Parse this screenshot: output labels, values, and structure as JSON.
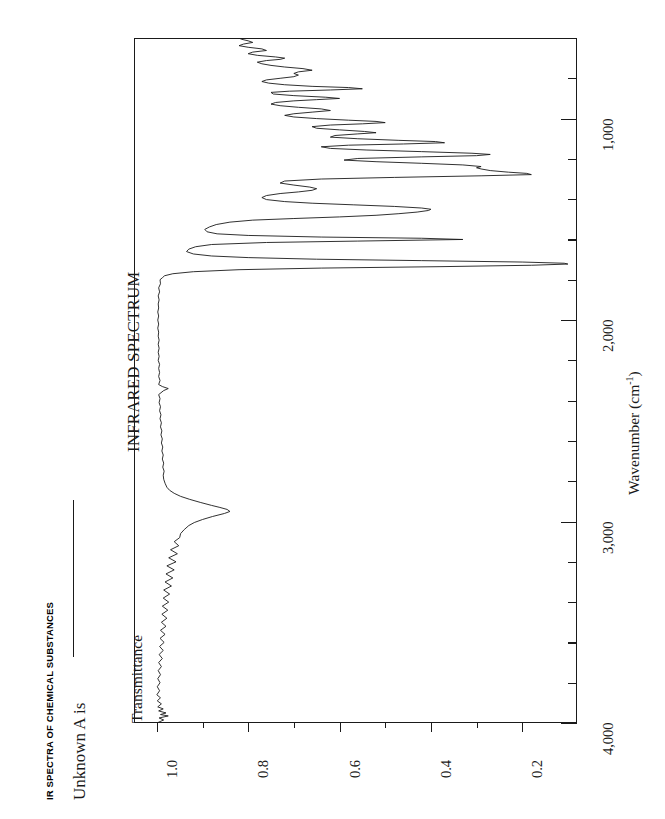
{
  "page": {
    "book_header": "IR SPECTRA OF CHEMICAL SUBSTANCES",
    "prompt_label": "Unknown A is",
    "blank_rule": "answer-blank"
  },
  "chart_data": {
    "type": "line",
    "title": "INFRARED SPECTRUM",
    "orientation": "rotated-90ccw",
    "xlabel": "Wavenumber (cm",
    "xlabel_sup": "-1",
    "xlabel_tail": ")",
    "ylabel": "Transmittance",
    "xlim": [
      4000,
      600
    ],
    "ylim": [
      1.05,
      0.08
    ],
    "grid": false,
    "legend": false,
    "x_ticks_major": [
      4000,
      3000,
      2000,
      1000
    ],
    "x_tick_labels": [
      "4,000",
      "3,000",
      "2,000",
      "1,000"
    ],
    "x_ticks_minor": [
      3800,
      3600,
      3400,
      3200,
      2800,
      2600,
      2400,
      2200,
      1800,
      1600,
      1400,
      1200,
      800
    ],
    "y_ticks_major": [
      1.0,
      0.8,
      0.6,
      0.4,
      0.2
    ],
    "y_tick_labels": [
      "1.0",
      "0.8",
      "0.6",
      "0.4",
      "0.2"
    ],
    "y_ticks_minor": [
      0.9,
      0.7,
      0.5,
      0.3
    ],
    "series_name": "transmittance",
    "notable_peaks": [
      {
        "wavenumber": 2950,
        "transmittance": 0.84,
        "assignment": "C-H stretch"
      },
      {
        "wavenumber": 1720,
        "transmittance": 0.1,
        "assignment": "C=O stretch"
      },
      {
        "wavenumber": 1600,
        "transmittance": 0.33
      },
      {
        "wavenumber": 1450,
        "transmittance": 0.4
      },
      {
        "wavenumber": 1280,
        "transmittance": 0.18
      },
      {
        "wavenumber": 1240,
        "transmittance": 0.3
      },
      {
        "wavenumber": 1180,
        "transmittance": 0.27
      },
      {
        "wavenumber": 1120,
        "transmittance": 0.37
      },
      {
        "wavenumber": 1070,
        "transmittance": 0.52
      },
      {
        "wavenumber": 1020,
        "transmittance": 0.5
      },
      {
        "wavenumber": 960,
        "transmittance": 0.62
      },
      {
        "wavenumber": 900,
        "transmittance": 0.6
      },
      {
        "wavenumber": 850,
        "transmittance": 0.55
      },
      {
        "wavenumber": 760,
        "transmittance": 0.66
      },
      {
        "wavenumber": 700,
        "transmittance": 0.72
      }
    ],
    "points": [
      [
        4000,
        1.0
      ],
      [
        3985,
        0.985
      ],
      [
        3975,
        0.995
      ],
      [
        3965,
        0.975
      ],
      [
        3958,
        0.992
      ],
      [
        3950,
        0.98
      ],
      [
        3940,
        0.996
      ],
      [
        3930,
        0.986
      ],
      [
        3920,
        0.998
      ],
      [
        3905,
        0.99
      ],
      [
        3890,
        0.999
      ],
      [
        3875,
        0.992
      ],
      [
        3860,
        1.0
      ],
      [
        3840,
        0.994
      ],
      [
        3820,
        0.999
      ],
      [
        3800,
        0.993
      ],
      [
        3780,
        0.998
      ],
      [
        3760,
        0.992
      ],
      [
        3740,
        0.997
      ],
      [
        3720,
        0.99
      ],
      [
        3700,
        0.996
      ],
      [
        3680,
        0.988
      ],
      [
        3660,
        0.995
      ],
      [
        3640,
        0.986
      ],
      [
        3620,
        0.994
      ],
      [
        3600,
        0.984
      ],
      [
        3580,
        0.993
      ],
      [
        3560,
        0.982
      ],
      [
        3540,
        0.992
      ],
      [
        3520,
        0.98
      ],
      [
        3500,
        0.99
      ],
      [
        3480,
        0.978
      ],
      [
        3460,
        0.989
      ],
      [
        3440,
        0.976
      ],
      [
        3420,
        0.988
      ],
      [
        3400,
        0.974
      ],
      [
        3380,
        0.986
      ],
      [
        3360,
        0.972
      ],
      [
        3340,
        0.985
      ],
      [
        3320,
        0.968
      ],
      [
        3300,
        0.982
      ],
      [
        3280,
        0.965
      ],
      [
        3260,
        0.98
      ],
      [
        3240,
        0.962
      ],
      [
        3220,
        0.978
      ],
      [
        3200,
        0.958
      ],
      [
        3180,
        0.974
      ],
      [
        3160,
        0.955
      ],
      [
        3140,
        0.97
      ],
      [
        3120,
        0.952
      ],
      [
        3100,
        0.962
      ],
      [
        3080,
        0.95
      ],
      [
        3060,
        0.948
      ],
      [
        3040,
        0.94
      ],
      [
        3020,
        0.93
      ],
      [
        3005,
        0.918
      ],
      [
        2990,
        0.9
      ],
      [
        2975,
        0.878
      ],
      [
        2960,
        0.852
      ],
      [
        2950,
        0.84
      ],
      [
        2940,
        0.846
      ],
      [
        2930,
        0.862
      ],
      [
        2920,
        0.88
      ],
      [
        2905,
        0.905
      ],
      [
        2890,
        0.928
      ],
      [
        2875,
        0.948
      ],
      [
        2860,
        0.962
      ],
      [
        2845,
        0.972
      ],
      [
        2830,
        0.978
      ],
      [
        2810,
        0.982
      ],
      [
        2790,
        0.985
      ],
      [
        2770,
        0.986
      ],
      [
        2750,
        0.984
      ],
      [
        2730,
        0.987
      ],
      [
        2710,
        0.985
      ],
      [
        2690,
        0.988
      ],
      [
        2670,
        0.986
      ],
      [
        2650,
        0.989
      ],
      [
        2630,
        0.987
      ],
      [
        2610,
        0.99
      ],
      [
        2590,
        0.988
      ],
      [
        2570,
        0.991
      ],
      [
        2550,
        0.989
      ],
      [
        2530,
        0.992
      ],
      [
        2510,
        0.99
      ],
      [
        2490,
        0.993
      ],
      [
        2470,
        0.991
      ],
      [
        2450,
        0.994
      ],
      [
        2430,
        0.992
      ],
      [
        2410,
        0.995
      ],
      [
        2390,
        0.993
      ],
      [
        2370,
        0.996
      ],
      [
        2350,
        0.985
      ],
      [
        2340,
        0.975
      ],
      [
        2330,
        0.988
      ],
      [
        2320,
        0.996
      ],
      [
        2300,
        0.993
      ],
      [
        2280,
        0.996
      ],
      [
        2260,
        0.994
      ],
      [
        2240,
        0.996
      ],
      [
        2220,
        0.994
      ],
      [
        2200,
        0.997
      ],
      [
        2180,
        0.995
      ],
      [
        2160,
        0.997
      ],
      [
        2140,
        0.995
      ],
      [
        2120,
        0.997
      ],
      [
        2100,
        0.995
      ],
      [
        2080,
        0.997
      ],
      [
        2060,
        0.996
      ],
      [
        2040,
        0.998
      ],
      [
        2020,
        0.996
      ],
      [
        2000,
        0.998
      ],
      [
        1980,
        0.996
      ],
      [
        1960,
        0.998
      ],
      [
        1940,
        0.996
      ],
      [
        1920,
        0.997
      ],
      [
        1900,
        0.995
      ],
      [
        1880,
        0.997
      ],
      [
        1860,
        0.994
      ],
      [
        1840,
        0.996
      ],
      [
        1820,
        0.992
      ],
      [
        1800,
        0.993
      ],
      [
        1790,
        0.988
      ],
      [
        1780,
        0.983
      ],
      [
        1770,
        0.965
      ],
      [
        1760,
        0.92
      ],
      [
        1750,
        0.82
      ],
      [
        1742,
        0.64
      ],
      [
        1735,
        0.38
      ],
      [
        1728,
        0.18
      ],
      [
        1722,
        0.1
      ],
      [
        1718,
        0.108
      ],
      [
        1712,
        0.2
      ],
      [
        1705,
        0.42
      ],
      [
        1698,
        0.65
      ],
      [
        1690,
        0.8
      ],
      [
        1682,
        0.88
      ],
      [
        1672,
        0.92
      ],
      [
        1660,
        0.935
      ],
      [
        1648,
        0.93
      ],
      [
        1636,
        0.915
      ],
      [
        1625,
        0.88
      ],
      [
        1615,
        0.76
      ],
      [
        1608,
        0.56
      ],
      [
        1600,
        0.33
      ],
      [
        1594,
        0.42
      ],
      [
        1588,
        0.64
      ],
      [
        1580,
        0.8
      ],
      [
        1572,
        0.868
      ],
      [
        1562,
        0.89
      ],
      [
        1550,
        0.895
      ],
      [
        1538,
        0.885
      ],
      [
        1526,
        0.87
      ],
      [
        1514,
        0.84
      ],
      [
        1504,
        0.79
      ],
      [
        1496,
        0.7
      ],
      [
        1488,
        0.6
      ],
      [
        1480,
        0.52
      ],
      [
        1472,
        0.47
      ],
      [
        1464,
        0.43
      ],
      [
        1456,
        0.405
      ],
      [
        1450,
        0.4
      ],
      [
        1444,
        0.42
      ],
      [
        1436,
        0.48
      ],
      [
        1428,
        0.57
      ],
      [
        1420,
        0.66
      ],
      [
        1412,
        0.72
      ],
      [
        1402,
        0.76
      ],
      [
        1392,
        0.77
      ],
      [
        1382,
        0.76
      ],
      [
        1372,
        0.73
      ],
      [
        1364,
        0.69
      ],
      [
        1356,
        0.66
      ],
      [
        1348,
        0.65
      ],
      [
        1340,
        0.665
      ],
      [
        1330,
        0.7
      ],
      [
        1320,
        0.73
      ],
      [
        1310,
        0.72
      ],
      [
        1300,
        0.64
      ],
      [
        1292,
        0.48
      ],
      [
        1284,
        0.29
      ],
      [
        1278,
        0.18
      ],
      [
        1272,
        0.19
      ],
      [
        1266,
        0.23
      ],
      [
        1258,
        0.27
      ],
      [
        1250,
        0.29
      ],
      [
        1244,
        0.3
      ],
      [
        1238,
        0.29
      ],
      [
        1230,
        0.33
      ],
      [
        1222,
        0.42
      ],
      [
        1214,
        0.52
      ],
      [
        1206,
        0.59
      ],
      [
        1198,
        0.56
      ],
      [
        1190,
        0.42
      ],
      [
        1184,
        0.3
      ],
      [
        1178,
        0.27
      ],
      [
        1172,
        0.31
      ],
      [
        1164,
        0.42
      ],
      [
        1156,
        0.54
      ],
      [
        1148,
        0.62
      ],
      [
        1140,
        0.64
      ],
      [
        1132,
        0.58
      ],
      [
        1126,
        0.46
      ],
      [
        1120,
        0.37
      ],
      [
        1114,
        0.39
      ],
      [
        1108,
        0.47
      ],
      [
        1100,
        0.56
      ],
      [
        1092,
        0.62
      ],
      [
        1084,
        0.61
      ],
      [
        1076,
        0.56
      ],
      [
        1070,
        0.52
      ],
      [
        1064,
        0.545
      ],
      [
        1056,
        0.6
      ],
      [
        1048,
        0.65
      ],
      [
        1040,
        0.66
      ],
      [
        1032,
        0.62
      ],
      [
        1026,
        0.55
      ],
      [
        1020,
        0.5
      ],
      [
        1014,
        0.52
      ],
      [
        1008,
        0.58
      ],
      [
        1000,
        0.65
      ],
      [
        992,
        0.7
      ],
      [
        984,
        0.72
      ],
      [
        976,
        0.7
      ],
      [
        968,
        0.66
      ],
      [
        960,
        0.62
      ],
      [
        952,
        0.64
      ],
      [
        944,
        0.69
      ],
      [
        936,
        0.73
      ],
      [
        928,
        0.75
      ],
      [
        920,
        0.74
      ],
      [
        912,
        0.7
      ],
      [
        906,
        0.65
      ],
      [
        900,
        0.6
      ],
      [
        894,
        0.63
      ],
      [
        886,
        0.7
      ],
      [
        878,
        0.745
      ],
      [
        870,
        0.75
      ],
      [
        864,
        0.71
      ],
      [
        858,
        0.62
      ],
      [
        852,
        0.55
      ],
      [
        846,
        0.58
      ],
      [
        840,
        0.66
      ],
      [
        832,
        0.72
      ],
      [
        824,
        0.755
      ],
      [
        816,
        0.77
      ],
      [
        808,
        0.76
      ],
      [
        800,
        0.73
      ],
      [
        792,
        0.7
      ],
      [
        784,
        0.69
      ],
      [
        776,
        0.7
      ],
      [
        768,
        0.69
      ],
      [
        760,
        0.66
      ],
      [
        752,
        0.68
      ],
      [
        744,
        0.72
      ],
      [
        736,
        0.75
      ],
      [
        728,
        0.77
      ],
      [
        720,
        0.78
      ],
      [
        712,
        0.76
      ],
      [
        706,
        0.73
      ],
      [
        700,
        0.72
      ],
      [
        694,
        0.74
      ],
      [
        686,
        0.78
      ],
      [
        678,
        0.8
      ],
      [
        670,
        0.79
      ],
      [
        662,
        0.76
      ],
      [
        654,
        0.77
      ],
      [
        646,
        0.8
      ],
      [
        638,
        0.82
      ],
      [
        630,
        0.81
      ],
      [
        622,
        0.79
      ],
      [
        614,
        0.8
      ],
      [
        606,
        0.815
      ],
      [
        600,
        0.82
      ]
    ]
  }
}
